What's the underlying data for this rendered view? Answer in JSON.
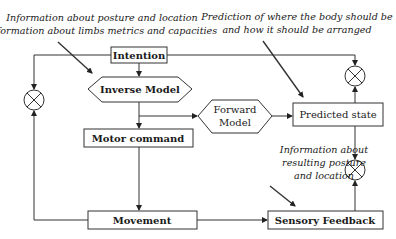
{
  "diagram": {
    "annotations": {
      "top_left": [
        "Information about posture and location",
        "Information about limbs metrics and capacities"
      ],
      "top_right": [
        "Prediction of where the body should be",
        "and how it should be arranged"
      ],
      "bottom_right": [
        "Information about",
        "resulting posture",
        "and location"
      ]
    },
    "nodes": {
      "intention": "Intention",
      "inverse_model": "Inverse Model",
      "forward_model": [
        "Forward",
        "Model"
      ],
      "predicted_state": "Predicted state",
      "motor_command": "Motor command",
      "movement": "Movement",
      "sensory_feedback": "Sensory Feedback"
    },
    "comparators": [
      "comparator-left",
      "comparator-top-right",
      "comparator-bottom-right"
    ],
    "colors": {
      "line": "#333333",
      "text": "#1a1a1a",
      "background": "#ffffff"
    }
  }
}
